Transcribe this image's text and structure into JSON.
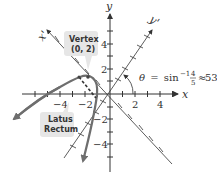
{
  "diagram": {
    "type": "rotated-parabola",
    "axes": {
      "x_label": "x",
      "y_label": "y",
      "x_prime_label": "x'",
      "y_prime_label": "y'",
      "x_ticks": [
        "−4",
        "−2",
        "2",
        "4"
      ],
      "y_ticks": [
        "4",
        "2",
        "−2",
        "−4"
      ]
    },
    "angle": {
      "theta_symbol": "θ",
      "equals": "=",
      "func": "sin",
      "exponent": "−1",
      "fraction_num": "4",
      "fraction_den": "5",
      "approx": "≈",
      "degrees": "53°"
    },
    "callouts": {
      "vertex_line1": "Vertex",
      "vertex_line2": "(0, 2)",
      "latus_line1": "Latus",
      "latus_line2": "Rectum"
    },
    "colors": {
      "curve": "#6e6e6e",
      "axes": "#333333",
      "callout_bg": "#e6e6e6"
    }
  }
}
